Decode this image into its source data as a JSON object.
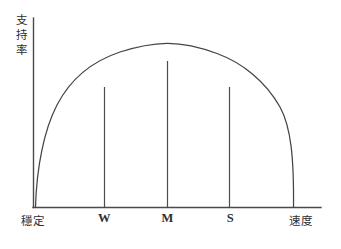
{
  "figure": {
    "background_color": "#ffffff",
    "ink_color": "#454545"
  },
  "axes": {
    "y_label": "支持率",
    "y_label_chars": [
      "支",
      "持",
      "率"
    ],
    "x_label_left": "穩定",
    "x_label_right": "速度"
  },
  "ticks": {
    "w": "W",
    "m": "M",
    "s": "S"
  },
  "chart_data": {
    "type": "line",
    "title": "",
    "subtitle": "",
    "xlabel": "穩定 → 速度",
    "ylabel": "支持率",
    "xlabel_left": "穩定",
    "xlabel_right": "速度",
    "grid": false,
    "legend": false,
    "legend_position": "none",
    "xlim": [
      0,
      1
    ],
    "ylim": [
      0,
      1
    ],
    "x_tick_labels": [
      "穩定",
      "W",
      "M",
      "S",
      "速度"
    ],
    "x_tick_positions": [
      0.0,
      0.268,
      0.512,
      0.752,
      1.0
    ],
    "y_tick_labels": [],
    "series": [
      {
        "name": "支持率曲線",
        "shape": "semi-elliptical arc",
        "x": [
          0.0,
          0.05,
          0.1,
          0.15,
          0.2,
          0.268,
          0.35,
          0.43,
          0.512,
          0.6,
          0.68,
          0.752,
          0.82,
          0.88,
          0.94,
          1.0
        ],
        "y": [
          0.0,
          0.44,
          0.6,
          0.7,
          0.78,
          0.845,
          0.91,
          0.96,
          1.0,
          0.975,
          0.925,
          0.845,
          0.74,
          0.62,
          0.45,
          0.0
        ]
      }
    ],
    "annotations": [
      {
        "name": "drop-line-w",
        "x": 0.268,
        "y_top": 0.845,
        "y_bottom": 0.0,
        "label": "W"
      },
      {
        "name": "drop-line-m",
        "x": 0.512,
        "y_top": 1.0,
        "y_bottom": 0.0,
        "label": "M"
      },
      {
        "name": "drop-line-s",
        "x": 0.752,
        "y_top": 0.845,
        "y_bottom": 0.0,
        "label": "S"
      }
    ]
  }
}
